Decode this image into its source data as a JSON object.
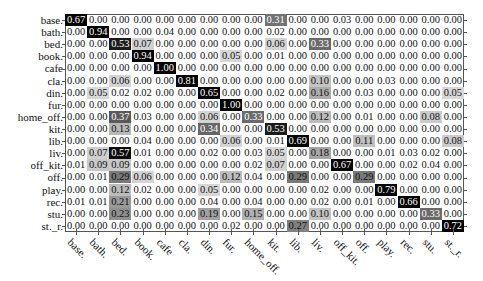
{
  "chart_data": {
    "type": "heatmap",
    "title": "",
    "xlabel": "",
    "ylabel": "",
    "row_labels": [
      "base.",
      "bath.",
      "bed.",
      "book.",
      "cafe",
      "cla.",
      "din.",
      "fur.",
      "home_off.",
      "kit.",
      "lib.",
      "liv.",
      "off_kit.",
      "off.",
      "play.",
      "rec.",
      "stu.",
      "st._r."
    ],
    "col_labels": [
      "base.",
      "bath.",
      "bed.",
      "book.",
      "cafe",
      "cla.",
      "din.",
      "fur.",
      "home_off.",
      "kit.",
      "lib.",
      "liv.",
      "off_kit.",
      "off.",
      "play.",
      "rec.",
      "stu.",
      "st._r."
    ],
    "values": [
      [
        0.67,
        0.0,
        0.0,
        0.0,
        0.0,
        0.0,
        0.0,
        0.0,
        0.0,
        0.31,
        0.0,
        0.0,
        0.03,
        0.0,
        0.0,
        0.0,
        0.0,
        0.0
      ],
      [
        0.0,
        0.94,
        0.0,
        0.0,
        0.04,
        0.0,
        0.0,
        0.0,
        0.0,
        0.02,
        0.0,
        0.0,
        0.0,
        0.0,
        0.0,
        0.0,
        0.0,
        0.0
      ],
      [
        0.0,
        0.0,
        0.53,
        0.07,
        0.0,
        0.0,
        0.0,
        0.0,
        0.0,
        0.06,
        0.0,
        0.33,
        0.0,
        0.0,
        0.0,
        0.0,
        0.0,
        0.0
      ],
      [
        0.0,
        0.0,
        0.0,
        0.94,
        0.0,
        0.0,
        0.0,
        0.05,
        0.0,
        0.01,
        0.0,
        0.0,
        0.0,
        0.0,
        0.0,
        0.0,
        0.0,
        0.0
      ],
      [
        0.0,
        0.0,
        0.0,
        0.0,
        1.0,
        0.0,
        0.0,
        0.0,
        0.0,
        0.0,
        0.0,
        0.0,
        0.0,
        0.0,
        0.0,
        0.0,
        0.0,
        0.0
      ],
      [
        0.0,
        0.0,
        0.06,
        0.0,
        0.0,
        0.81,
        0.0,
        0.0,
        0.0,
        0.0,
        0.0,
        0.1,
        0.0,
        0.0,
        0.03,
        0.0,
        0.0,
        0.0
      ],
      [
        0.0,
        0.05,
        0.02,
        0.02,
        0.0,
        0.0,
        0.65,
        0.0,
        0.0,
        0.02,
        0.0,
        0.16,
        0.0,
        0.03,
        0.0,
        0.0,
        0.0,
        0.05
      ],
      [
        0.0,
        0.0,
        0.0,
        0.0,
        0.0,
        0.0,
        0.0,
        1.0,
        0.0,
        0.0,
        0.0,
        0.0,
        0.0,
        0.0,
        0.0,
        0.0,
        0.0,
        0.0
      ],
      [
        0.0,
        0.0,
        0.37,
        0.03,
        0.0,
        0.0,
        0.06,
        0.0,
        0.33,
        0.0,
        0.0,
        0.12,
        0.0,
        0.01,
        0.0,
        0.0,
        0.08,
        0.0
      ],
      [
        0.0,
        0.0,
        0.13,
        0.0,
        0.0,
        0.0,
        0.34,
        0.0,
        0.0,
        0.53,
        0.0,
        0.0,
        0.0,
        0.0,
        0.0,
        0.0,
        0.0,
        0.0
      ],
      [
        0.0,
        0.0,
        0.0,
        0.04,
        0.0,
        0.0,
        0.0,
        0.06,
        0.0,
        0.01,
        0.69,
        0.0,
        0.0,
        0.11,
        0.0,
        0.0,
        0.0,
        0.08
      ],
      [
        0.0,
        0.07,
        0.57,
        0.01,
        0.0,
        0.0,
        0.02,
        0.0,
        0.03,
        0.05,
        0.0,
        0.18,
        0.0,
        0.0,
        0.01,
        0.03,
        0.02,
        0.0
      ],
      [
        0.01,
        0.09,
        0.09,
        0.0,
        0.0,
        0.0,
        0.0,
        0.0,
        0.02,
        0.07,
        0.0,
        0.0,
        0.67,
        0.0,
        0.0,
        0.02,
        0.04,
        0.0
      ],
      [
        0.0,
        0.01,
        0.29,
        0.06,
        0.0,
        0.0,
        0.0,
        0.12,
        0.04,
        0.0,
        0.29,
        0.0,
        0.0,
        0.29,
        0.0,
        0.0,
        0.0,
        0.0
      ],
      [
        0.0,
        0.0,
        0.12,
        0.02,
        0.0,
        0.0,
        0.05,
        0.0,
        0.0,
        0.0,
        0.0,
        0.02,
        0.0,
        0.0,
        0.79,
        0.0,
        0.0,
        0.0
      ],
      [
        0.01,
        0.01,
        0.21,
        0.0,
        0.0,
        0.0,
        0.04,
        0.0,
        0.04,
        0.0,
        0.0,
        0.02,
        0.0,
        0.01,
        0.0,
        0.66,
        0.0,
        0.0
      ],
      [
        0.0,
        0.0,
        0.23,
        0.0,
        0.0,
        0.0,
        0.19,
        0.0,
        0.15,
        0.0,
        0.0,
        0.1,
        0.0,
        0.0,
        0.0,
        0.0,
        0.33,
        0.0
      ],
      [
        0.0,
        0.0,
        0.0,
        0.0,
        0.0,
        0.0,
        0.0,
        0.02,
        0.0,
        0.0,
        0.27,
        0.0,
        0.0,
        0.0,
        0.0,
        0.0,
        0.0,
        0.72
      ]
    ],
    "value_range": [
      0,
      1
    ],
    "colormap": "white-to-black",
    "legend": "none",
    "grid": false
  }
}
